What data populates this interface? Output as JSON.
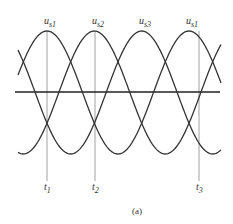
{
  "diagram": {
    "caption": "(a)",
    "top_labels": [
      {
        "main": "u",
        "sub": "s1",
        "x": 47
      },
      {
        "main": "u",
        "sub": "s2",
        "x": 95
      },
      {
        "main": "u",
        "sub": "s3",
        "x": 142
      },
      {
        "main": "u",
        "sub": "s1",
        "x": 189
      }
    ],
    "time_markers": [
      {
        "main": "t",
        "sub": "1",
        "x": 47
      },
      {
        "main": "t",
        "sub": "2",
        "x": 95
      },
      {
        "main": "t",
        "sub": "3",
        "x": 199
      }
    ],
    "waves": {
      "count": 3,
      "phase_shift_deg": 120,
      "peak_y": 31,
      "trough_y": 154,
      "axis_y": 92
    },
    "colors": {
      "curve": "#333333",
      "guide": "#888888",
      "axis": "#222222"
    }
  }
}
